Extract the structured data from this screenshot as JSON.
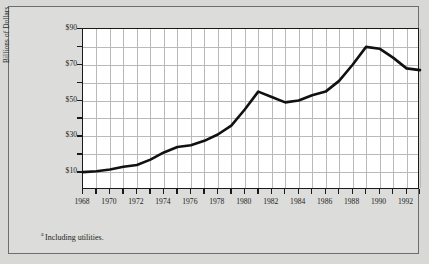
{
  "footnote": {
    "marker": "a",
    "text": "Including utilities."
  },
  "chart_data": {
    "type": "line",
    "title": "",
    "xlabel": "",
    "ylabel": "Billions of Dollars",
    "xlim": [
      1968,
      1993
    ],
    "ylim": [
      0,
      90
    ],
    "grid": true,
    "legend": false,
    "y_ticks": [
      10,
      20,
      30,
      40,
      50,
      60,
      70,
      80,
      90
    ],
    "y_tick_labels": [
      "$10",
      "",
      "$30",
      "",
      "$50",
      "",
      "$70",
      "",
      "$90"
    ],
    "x_ticks": [
      1968,
      1969,
      1970,
      1971,
      1972,
      1973,
      1974,
      1975,
      1976,
      1977,
      1978,
      1979,
      1980,
      1981,
      1982,
      1983,
      1984,
      1985,
      1986,
      1987,
      1988,
      1989,
      1990,
      1991,
      1992,
      1993
    ],
    "x_tick_labels": [
      "1968",
      "",
      "1970",
      "",
      "1972",
      "",
      "1974",
      "",
      "1976",
      "",
      "1978",
      "",
      "1980",
      "",
      "1982",
      "",
      "1984",
      "",
      "1986",
      "",
      "1988",
      "",
      "1990",
      "",
      "1992",
      ""
    ],
    "line_color": "#111111",
    "x": [
      1968,
      1969,
      1970,
      1971,
      1972,
      1973,
      1974,
      1975,
      1976,
      1977,
      1978,
      1979,
      1980,
      1981,
      1982,
      1983,
      1984,
      1985,
      1986,
      1987,
      1988,
      1989,
      1990,
      1991,
      1992,
      1993
    ],
    "values": [
      10,
      10.5,
      11.5,
      13,
      14,
      17,
      21,
      24,
      25,
      27.5,
      31,
      36,
      45,
      55,
      52,
      49,
      50,
      53,
      55,
      61,
      70,
      80,
      79,
      74,
      68,
      67
    ]
  }
}
